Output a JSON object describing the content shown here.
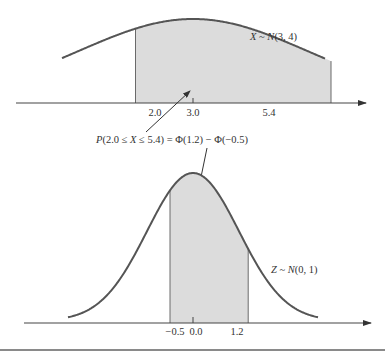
{
  "chart_data": [
    {
      "type": "area",
      "title": "",
      "distribution_label": "X ~ N(3, 4)",
      "distribution": {
        "name": "normal",
        "mean": 3.0,
        "variance": 4.0,
        "sd": 2.0
      },
      "shaded_interval": [
        2.0,
        5.4
      ],
      "x_ticks": [
        "2.0",
        "3.0",
        "5.4"
      ],
      "x_tick_values": [
        2.0,
        3.0,
        5.4
      ],
      "xlabel": "",
      "ylabel": "",
      "grid": false
    },
    {
      "type": "area",
      "title": "",
      "distribution_label": "Z ~ N(0, 1)",
      "distribution": {
        "name": "normal",
        "mean": 0.0,
        "variance": 1.0,
        "sd": 1.0
      },
      "shaded_interval": [
        -0.5,
        1.2
      ],
      "x_ticks": [
        "−0.5",
        "0.0",
        "1.2"
      ],
      "x_tick_values": [
        -0.5,
        0.0,
        1.2
      ],
      "xlabel": "",
      "ylabel": "",
      "grid": false
    }
  ],
  "top": {
    "label_var": "X",
    "label_rest": " ~ ",
    "label_N": "N",
    "label_params": "(3, 4)",
    "ticks": [
      "2.0",
      "3.0",
      "5.4"
    ]
  },
  "bottom": {
    "label_var": "Z",
    "label_rest": " ~ ",
    "label_N": "N",
    "label_params": "(0, 1)",
    "ticks": [
      "−0.5",
      "0.0",
      "1.2"
    ]
  },
  "annotation": {
    "p": "P",
    "part1": "(2.0 ≤ ",
    "x": "X",
    "part2": " ≤ 5.4) = Φ(1.2) − Φ(−0.5)"
  },
  "colors": {
    "curve": "#555555",
    "shade": "#dcdcdc",
    "axis": "#444444",
    "boundary": "#6a6a6a",
    "rule": "#8a8a8a"
  }
}
